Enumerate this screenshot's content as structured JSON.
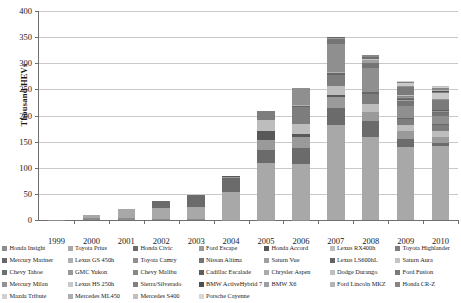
{
  "chart_data": {
    "type": "bar",
    "stacked": true,
    "title": "",
    "subtitle": "",
    "xlabel": "",
    "ylabel": "Thousand HEVs",
    "ylim": [
      0,
      400
    ],
    "yticks": [
      0,
      50,
      100,
      150,
      200,
      250,
      300,
      350,
      400
    ],
    "ytick_labels": [
      "0",
      "50",
      "100",
      "150",
      "200",
      "250",
      "300",
      "350",
      "400"
    ],
    "grid": true,
    "legend_position": "bottom",
    "legend_columns": 7,
    "legend_rows": 4,
    "categories": [
      "1999",
      "2000",
      "2001",
      "2002",
      "2003",
      "2004",
      "2005",
      "2006",
      "2007",
      "2008",
      "2009",
      "2010"
    ],
    "totals": [
      0.3,
      9,
      20,
      36,
      48,
      84,
      209,
      253,
      352,
      313,
      290,
      274
    ],
    "series": [
      {
        "name": "Honda Insight",
        "color": "#8c8c8c",
        "values": [
          0.3,
          3.8,
          4.7,
          2.2,
          1.2,
          0.6,
          0.7,
          0.3,
          0,
          0,
          0,
          0
        ]
      },
      {
        "name": "Toyota Prius",
        "color": "#a8a8a8",
        "values": [
          0,
          5.2,
          15.5,
          20.1,
          24.6,
          53.9,
          107.9,
          106.9,
          181.2,
          158.6,
          139.7,
          140.9
        ]
      },
      {
        "name": "Honda Civic",
        "color": "#6b6b6b",
        "values": [
          0,
          0,
          0,
          13.7,
          21.8,
          25.6,
          25.8,
          31.3,
          32.6,
          31.3,
          15.1,
          7.3
        ]
      },
      {
        "name": "Ford Escape",
        "color": "#9a9a9a",
        "values": [
          0,
          0,
          0,
          0,
          0,
          2.6,
          18.8,
          20.1,
          21.4,
          17.2,
          14.8,
          11.2
        ]
      },
      {
        "name": "Honda Accord",
        "color": "#585858",
        "values": [
          0,
          0,
          0,
          0,
          0,
          1.3,
          16.8,
          5.6,
          3.4,
          0,
          0,
          0
        ]
      },
      {
        "name": "Lexus RX400h",
        "color": "#bdbdbd",
        "values": [
          0,
          0,
          0,
          0,
          0,
          0,
          20.7,
          20.2,
          17.3,
          15.2,
          12.1,
          10.1
        ]
      },
      {
        "name": "Toyota Highlander",
        "color": "#7d7d7d",
        "values": [
          0,
          0,
          0,
          0,
          0,
          0,
          17.9,
          31.5,
          22.0,
          19.3,
          11.4,
          12.2
        ]
      },
      {
        "name": "Mercury Mariner",
        "color": "#676767",
        "values": [
          0,
          0,
          0,
          0,
          0,
          0,
          1.0,
          3.2,
          3.6,
          2.9,
          2.3,
          1.5
        ]
      },
      {
        "name": "Lexus GS 450h",
        "color": "#b0b0b0",
        "values": [
          0,
          0,
          0,
          0,
          0,
          0,
          0,
          1.8,
          1.6,
          1.0,
          0.7,
          0.5
        ]
      },
      {
        "name": "Toyota Camry",
        "color": "#8f8f8f",
        "values": [
          0,
          0,
          0,
          0,
          0,
          0,
          0,
          31.3,
          54.5,
          46.3,
          22.9,
          14.6
        ]
      },
      {
        "name": "Nissan Altima",
        "color": "#757575",
        "values": [
          0,
          0,
          0,
          0,
          0,
          0,
          0,
          0,
          8.4,
          8.8,
          9.4,
          7.0
        ]
      },
      {
        "name": "Saturn Vue",
        "color": "#a0a0a0",
        "values": [
          0,
          0,
          0,
          0,
          0,
          0,
          0,
          0,
          3.2,
          5.2,
          2.1,
          0
        ]
      },
      {
        "name": "Lexus LS600hL",
        "color": "#636363",
        "values": [
          0,
          0,
          0,
          0,
          0,
          0,
          0,
          0,
          0.9,
          1.0,
          0.5,
          0.4
        ]
      },
      {
        "name": "Saturn Aura",
        "color": "#c4c4c4",
        "values": [
          0,
          0,
          0,
          0,
          0,
          0,
          0,
          0,
          0.8,
          1.6,
          0.5,
          0
        ]
      },
      {
        "name": "Chevy Tahoe",
        "color": "#6f6f6f",
        "values": [
          0,
          0,
          0,
          0,
          0,
          0,
          0,
          0,
          0,
          3.3,
          2.7,
          1.8
        ]
      },
      {
        "name": "GMC Yukon",
        "color": "#989898",
        "values": [
          0,
          0,
          0,
          0,
          0,
          0,
          0,
          0,
          0,
          1.4,
          1.1,
          0.8
        ]
      },
      {
        "name": "Chevy Malibu",
        "color": "#888888",
        "values": [
          0,
          0,
          0,
          0,
          0,
          0,
          0,
          0,
          0,
          2.0,
          1.8,
          0.6
        ]
      },
      {
        "name": "Cadillac Escalade",
        "color": "#5e5e5e",
        "values": [
          0,
          0,
          0,
          0,
          0,
          0,
          0,
          0,
          0,
          0.8,
          1.2,
          0.9
        ]
      },
      {
        "name": "Chrysler Aspen",
        "color": "#ababab",
        "values": [
          0,
          0,
          0,
          0,
          0,
          0,
          0,
          0,
          0,
          0.3,
          0.2,
          0
        ]
      },
      {
        "name": "Dodge Durango",
        "color": "#bfbfbf",
        "values": [
          0,
          0,
          0,
          0,
          0,
          0,
          0,
          0,
          0,
          0.3,
          0.2,
          0
        ]
      },
      {
        "name": "Ford Fusion",
        "color": "#7a7a7a",
        "values": [
          0,
          0,
          0,
          0,
          0,
          0,
          0,
          0,
          0,
          0,
          15.6,
          20.8
        ]
      },
      {
        "name": "Mercury Milan",
        "color": "#929292",
        "values": [
          0,
          0,
          0,
          0,
          0,
          0,
          0,
          0,
          0,
          0,
          2.1,
          1.9
        ]
      },
      {
        "name": "Lexus HS 250h",
        "color": "#c9c9c9",
        "values": [
          0,
          0,
          0,
          0,
          0,
          0,
          0,
          0,
          0,
          0,
          6.7,
          10.7
        ]
      },
      {
        "name": "Sierra/Silverado",
        "color": "#808080",
        "values": [
          0,
          0,
          0,
          0,
          0,
          0,
          0,
          0,
          0,
          0,
          1.8,
          2.1
        ]
      },
      {
        "name": "BMW ActiveHybrid 7",
        "color": "#4f4f4f",
        "values": [
          0,
          0,
          0,
          0,
          0,
          0,
          0,
          0,
          0,
          0,
          0.3,
          1.1
        ]
      },
      {
        "name": "BMW X6",
        "color": "#9e9e9e",
        "values": [
          0,
          0,
          0,
          0,
          0,
          0,
          0,
          0,
          0,
          0,
          0.2,
          0.6
        ]
      },
      {
        "name": "Ford Lincoln MKZ",
        "color": "#b5b5b5",
        "values": [
          0,
          0,
          0,
          0,
          0,
          0,
          0,
          0,
          0,
          0,
          0,
          1.5
        ]
      },
      {
        "name": "Honda CR-Z",
        "color": "#868686",
        "values": [
          0,
          0,
          0,
          0,
          0,
          0,
          0,
          0,
          0,
          0,
          0,
          5.2
        ]
      },
      {
        "name": "Mazda Tribute",
        "color": "#d0d0d0",
        "values": [
          0,
          0,
          0,
          0,
          0,
          0,
          0,
          0,
          0,
          0,
          0.4,
          0.6
        ]
      },
      {
        "name": "Mercedes ML450",
        "color": "#aeaeae",
        "values": [
          0,
          0,
          0,
          0,
          0,
          0,
          0,
          0,
          0,
          0,
          0.3,
          1.2
        ]
      },
      {
        "name": "Mercedes S400",
        "color": "#c0c0c0",
        "values": [
          0,
          0,
          0,
          0,
          0,
          0,
          0,
          0,
          0,
          0,
          0.5,
          1.3
        ]
      },
      {
        "name": "Porsche Cayenne",
        "color": "#d6d6d6",
        "values": [
          0,
          0,
          0,
          0,
          0,
          0,
          0,
          0,
          0,
          0,
          0,
          0.4
        ]
      }
    ]
  },
  "legend": {
    "items": [
      {
        "label": "Honda Insight",
        "color": "#8c8c8c"
      },
      {
        "label": "Toyota Prius",
        "color": "#a8a8a8"
      },
      {
        "label": "Honda Civic",
        "color": "#6b6b6b"
      },
      {
        "label": "Ford Escape",
        "color": "#9a9a9a"
      },
      {
        "label": "Honda Accord",
        "color": "#585858"
      },
      {
        "label": "Lexus RX400h",
        "color": "#bdbdbd"
      },
      {
        "label": "Toyota Highlander",
        "color": "#7d7d7d"
      },
      {
        "label": "Mercury Mariner",
        "color": "#676767"
      },
      {
        "label": "Lexus GS 450h",
        "color": "#b0b0b0"
      },
      {
        "label": "Toyota Camry",
        "color": "#8f8f8f"
      },
      {
        "label": "Nissan Altima",
        "color": "#757575"
      },
      {
        "label": "Saturn Vue",
        "color": "#a0a0a0"
      },
      {
        "label": "Lexus LS600hL",
        "color": "#636363"
      },
      {
        "label": "Saturn Aura",
        "color": "#c4c4c4"
      },
      {
        "label": "Chevy Tahoe",
        "color": "#6f6f6f"
      },
      {
        "label": "GMC Yukon",
        "color": "#989898"
      },
      {
        "label": "Chevy Malibu",
        "color": "#888888"
      },
      {
        "label": "Cadillac Escalade",
        "color": "#5e5e5e"
      },
      {
        "label": "Chrysler Aspen",
        "color": "#ababab"
      },
      {
        "label": "Dodge Durango",
        "color": "#bfbfbf"
      },
      {
        "label": "Ford Fusion",
        "color": "#7a7a7a"
      },
      {
        "label": "Mercury Milan",
        "color": "#929292"
      },
      {
        "label": "Lexus HS 250h",
        "color": "#c9c9c9"
      },
      {
        "label": "Sierra/Silverado",
        "color": "#808080"
      },
      {
        "label": "BMW ActiveHybrid 7",
        "color": "#4f4f4f"
      },
      {
        "label": "BMW X6",
        "color": "#9e9e9e"
      },
      {
        "label": "Ford Lincoln MKZ",
        "color": "#b5b5b5"
      },
      {
        "label": "Honda CR-Z",
        "color": "#868686"
      },
      {
        "label": "Mazda Tribute",
        "color": "#d0d0d0"
      },
      {
        "label": "Mercedes ML450",
        "color": "#aeaeae"
      },
      {
        "label": "Mercedes S400",
        "color": "#c0c0c0"
      },
      {
        "label": "Porsche Cayenne",
        "color": "#d6d6d6"
      }
    ]
  },
  "colors": {
    "axis": "#6f6f6f",
    "gridline": "#c9c9c9",
    "background": "#ffffff",
    "text": "#1a1a1a"
  }
}
